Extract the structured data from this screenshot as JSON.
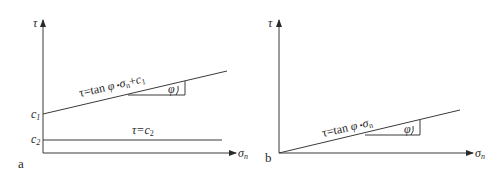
{
  "panels": [
    {
      "id": "a",
      "panel_label": "a",
      "y_axis_label": "τ",
      "x_axis_label_main": "σ",
      "x_axis_label_sub": "n",
      "intercept_labels": [
        {
          "main": "c",
          "sub": "1"
        },
        {
          "main": "c",
          "sub": "2"
        }
      ],
      "line1_equation": {
        "prefix": "τ=tan ",
        "phi": "φ",
        "dot": " •",
        "sigma": "σ",
        "sigma_sub": "n",
        "plus": "+",
        "c": "c",
        "c_sub": "1"
      },
      "line2_equation": {
        "prefix": "τ=",
        "c": "c",
        "c_sub": "2"
      },
      "angle_label": "φ"
    },
    {
      "id": "b",
      "panel_label": "b",
      "y_axis_label": "τ",
      "x_axis_label_main": "σ",
      "x_axis_label_sub": "n",
      "line_equation": {
        "prefix": "τ=tan ",
        "phi": "φ",
        "dot": " •",
        "sigma": "σ",
        "sigma_sub": "n"
      },
      "angle_label": "φ"
    }
  ],
  "colors": {
    "stroke": "#3a3a3a",
    "text": "#2a2a2a",
    "background": "#ffffff"
  }
}
